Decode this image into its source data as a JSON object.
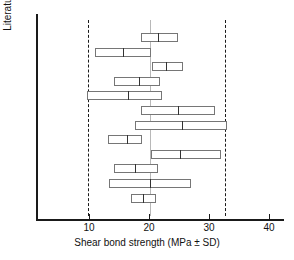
{
  "chart_data": {
    "type": "bar",
    "title": "",
    "xlabel": "Shear bond strength (MPa ± SD)",
    "ylabel": "Literature citations",
    "xlim": [
      0,
      42
    ],
    "xticks": [
      10,
      20,
      30,
      40
    ],
    "xtick_labels": [
      "10",
      "20",
      "30",
      "40"
    ],
    "grid": false,
    "legend": null,
    "orientation": "horizontal",
    "reference_lines": [
      {
        "name": "lower-ci-line",
        "value": 9.8,
        "style": "dashed",
        "color": "#1a1a1a"
      },
      {
        "name": "pooled-mean-line",
        "value": 20.2,
        "style": "solid",
        "color": "#b8b8b8"
      },
      {
        "name": "upper-ci-line",
        "value": 32.7,
        "style": "dashed",
        "color": "#1a1a1a"
      }
    ],
    "series": [
      {
        "name": "citation-1",
        "mean": 21.5,
        "low": 18.7,
        "high": 24.8
      },
      {
        "name": "citation-2",
        "mean": 15.7,
        "low": 11.0,
        "high": 20.3
      },
      {
        "name": "citation-3",
        "mean": 22.8,
        "low": 20.5,
        "high": 25.7
      },
      {
        "name": "citation-4",
        "mean": 18.3,
        "low": 14.2,
        "high": 21.8
      },
      {
        "name": "citation-5",
        "mean": 16.5,
        "low": 9.7,
        "high": 22.2
      },
      {
        "name": "citation-6",
        "mean": 24.8,
        "low": 18.7,
        "high": 31.0
      },
      {
        "name": "citation-7",
        "mean": 25.5,
        "low": 17.7,
        "high": 33.0
      },
      {
        "name": "citation-8",
        "mean": 16.3,
        "low": 13.2,
        "high": 18.8
      },
      {
        "name": "citation-9",
        "mean": 25.2,
        "low": 20.3,
        "high": 32.0
      },
      {
        "name": "citation-10",
        "mean": 17.7,
        "low": 14.2,
        "high": 21.5
      },
      {
        "name": "citation-11",
        "mean": 20.2,
        "low": 13.3,
        "high": 27.0
      },
      {
        "name": "citation-12",
        "mean": 19.0,
        "low": 17.0,
        "high": 21.2
      }
    ]
  }
}
